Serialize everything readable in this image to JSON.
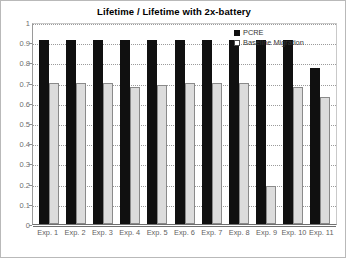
{
  "chart_data": {
    "type": "bar",
    "title": "Lifetime / Lifetime with 2x-battery",
    "xlabel": "",
    "ylabel": "",
    "ylim": [
      0,
      1
    ],
    "ytick_labels": [
      "1",
      "0.9",
      "0.8",
      "0.7",
      "0.6",
      "0.5",
      "0.4",
      "0.3",
      "0.2",
      "0.1",
      "0"
    ],
    "ytick_values": [
      1,
      0.9,
      0.8,
      0.7,
      0.6,
      0.5,
      0.4,
      0.3,
      0.2,
      0.1,
      0
    ],
    "grid": true,
    "legend_position": "top-right",
    "categories": [
      "Exp. 1",
      "Exp. 2",
      "Exp. 3",
      "Exp. 4",
      "Exp. 5",
      "Exp. 6",
      "Exp. 7",
      "Exp. 8",
      "Exp. 9",
      "Exp. 10",
      "Exp. 11"
    ],
    "series": [
      {
        "name": "PCRE",
        "color": "#101010",
        "values": [
          0.91,
          0.91,
          0.91,
          0.91,
          0.91,
          0.91,
          0.91,
          0.91,
          0.91,
          0.91,
          0.77
        ]
      },
      {
        "name": "Baseline Migration",
        "color": "#dcdcdc",
        "values": [
          0.7,
          0.7,
          0.7,
          0.68,
          0.69,
          0.7,
          0.7,
          0.7,
          0.19,
          0.68,
          0.63
        ]
      }
    ]
  },
  "legend": {
    "items": [
      {
        "label": "PCRE",
        "marker": "filled-square-swatch"
      },
      {
        "label": "Baseline Migration",
        "marker": "outlined-square-swatch"
      }
    ]
  }
}
